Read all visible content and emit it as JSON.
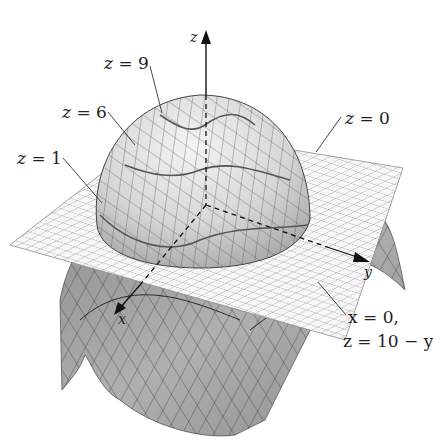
{
  "figure": {
    "type": "3d-surface-diagram",
    "surface_description": "Paraboloid-like dome cut by horizontal plane z = 0, with lower saddle-shaped surface below the plane",
    "axes": {
      "z_label": "z",
      "y_label": "y",
      "x_label": "x"
    },
    "level_labels": [
      {
        "id": "z9",
        "var": "z",
        "eq": "=",
        "value": "9"
      },
      {
        "id": "z6",
        "var": "z",
        "eq": "=",
        "value": "6"
      },
      {
        "id": "z1",
        "var": "z",
        "eq": "=",
        "value": "1"
      },
      {
        "id": "z0",
        "var": "z",
        "eq": "=",
        "value": "0"
      }
    ],
    "trace_label": {
      "line1": "x = 0,",
      "line2": "z = 10 − y"
    },
    "colors": {
      "background": "#ffffff",
      "surface_light": "#d9d9d9",
      "surface_dark": "#9a9a9a",
      "plane": "#f2f2f2",
      "grid": "#6a6a6a",
      "axis": "#111111",
      "text": "#222222"
    }
  }
}
